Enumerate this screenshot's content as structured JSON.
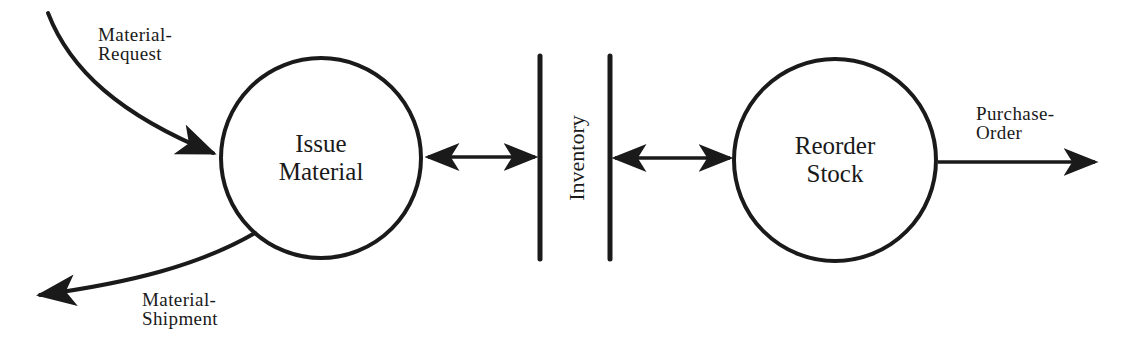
{
  "diagram": {
    "type": "data-flow-diagram",
    "colors": {
      "stroke": "#1a1a1a",
      "background": "#ffffff"
    },
    "processes": [
      {
        "id": "issue-material",
        "line1": "Issue",
        "line2": "Material"
      },
      {
        "id": "reorder-stock",
        "line1": "Reorder",
        "line2": "Stock"
      }
    ],
    "data_store": {
      "id": "inventory",
      "label": "Inventory"
    },
    "flows": [
      {
        "id": "material-request",
        "line1": "Material-",
        "line2": "Request",
        "from": "external",
        "to": "issue-material"
      },
      {
        "id": "material-shipment",
        "line1": "Material-",
        "line2": "Shipment",
        "from": "issue-material",
        "to": "external"
      },
      {
        "id": "purchase-order",
        "line1": "Purchase-",
        "line2": "Order",
        "from": "reorder-stock",
        "to": "external"
      },
      {
        "id": "issue-inventory",
        "label": "",
        "from": "issue-material",
        "to": "inventory",
        "bidirectional": true
      },
      {
        "id": "inventory-reorder",
        "label": "",
        "from": "inventory",
        "to": "reorder-stock",
        "bidirectional": true
      }
    ]
  }
}
